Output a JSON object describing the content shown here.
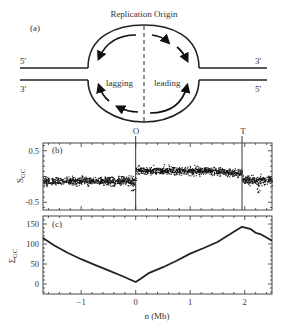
{
  "figure": {
    "panel_a": {
      "label": "(a)",
      "title": "Replication Origin",
      "left_top_strand": "5'",
      "left_bottom_strand": "3'",
      "right_top_strand": "3'",
      "right_bottom_strand": "5'",
      "lagging_label": "lagging",
      "leading_label": "leading",
      "origin_marker": "O",
      "terminus_marker": "T"
    },
    "panel_b": {
      "label": "(b)"
    },
    "panel_c": {
      "label": "(c)"
    },
    "caption_fragment": ""
  },
  "chart_data": [
    {
      "type": "scatter",
      "panel": "(b)",
      "title": "",
      "xlabel": "n (Mb)",
      "ylabel": "S_GC",
      "xlim": [
        -1.7,
        2.5
      ],
      "ylim": [
        -0.65,
        0.65
      ],
      "yticks": [
        -0.5,
        0.5
      ],
      "ytick_labels": [
        "-0.5",
        "0.5"
      ],
      "xticks": [
        -1,
        0,
        1,
        2
      ],
      "grid": false,
      "vertical_lines": [
        {
          "x": 0.0,
          "label": "O"
        },
        {
          "x": 1.95,
          "label": "T"
        }
      ],
      "segments": [
        {
          "x_range": [
            -1.7,
            0.0
          ],
          "mean": -0.08,
          "spread": 0.12
        },
        {
          "x_range": [
            0.0,
            1.95
          ],
          "mean": 0.12,
          "spread": 0.12
        },
        {
          "x_range": [
            1.95,
            2.5
          ],
          "mean": -0.06,
          "spread": 0.13
        }
      ],
      "notable_dips": [
        {
          "x": -0.05,
          "y": -0.3
        },
        {
          "x": 2.25,
          "y": -0.32
        }
      ]
    },
    {
      "type": "line",
      "panel": "(c)",
      "title": "",
      "xlabel": "n (Mb)",
      "ylabel": "Σ_GC",
      "xlim": [
        -1.7,
        2.5
      ],
      "ylim": [
        -25,
        170
      ],
      "yticks": [
        0,
        50,
        100,
        150
      ],
      "ytick_labels": [
        "0",
        "50",
        "100",
        "150"
      ],
      "xticks": [
        -1,
        0,
        1,
        2
      ],
      "xtick_labels": [
        "−1",
        "0",
        "1",
        "2"
      ],
      "grid": false,
      "x": [
        -1.7,
        -1.5,
        -1.25,
        -1.0,
        -0.75,
        -0.5,
        -0.25,
        0.0,
        0.1,
        0.25,
        0.5,
        0.75,
        1.0,
        1.25,
        1.5,
        1.75,
        1.95,
        2.1,
        2.2,
        2.3,
        2.4,
        2.5
      ],
      "y": [
        115,
        97,
        78,
        62,
        48,
        34,
        20,
        5,
        14,
        28,
        42,
        58,
        76,
        90,
        105,
        126,
        143,
        138,
        128,
        124,
        116,
        108
      ]
    }
  ]
}
